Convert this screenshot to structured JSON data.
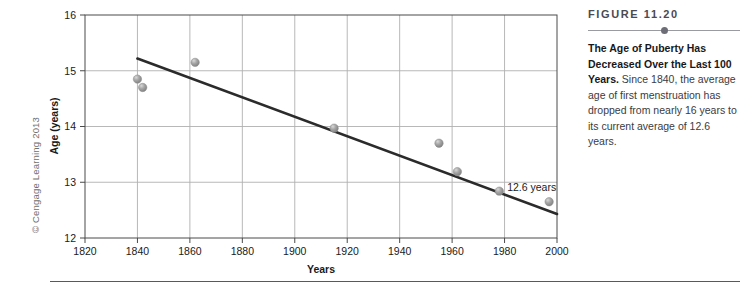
{
  "copyright": "© Cengage Learning 2013",
  "caption": {
    "figure_number": "FIGURE 11.20",
    "lead": "The Age of Puberty Has Decreased Over the Last 100 Years.",
    "body": " Since 1840, the average age of first menstruation has dropped from nearly 16 years to its current average of 12.6 years."
  },
  "colors": {
    "trend_line": "#2b2b2b",
    "grid": "#b0b0b0",
    "axis": "#4a4a4a",
    "point_fill": "#9b9b9b",
    "point_highlight": "#d8d8d8",
    "caption_heading": "#4a4a52",
    "caption_text": "#3b3b41",
    "rule": "#9a9aa2"
  },
  "chart_data": {
    "type": "scatter",
    "title": "",
    "xlabel": "Years",
    "ylabel": "Age (years)",
    "xlim": [
      1820,
      2000
    ],
    "ylim": [
      12,
      16
    ],
    "xticks": [
      1820,
      1840,
      1860,
      1880,
      1900,
      1920,
      1940,
      1960,
      1980,
      2000
    ],
    "yticks": [
      12,
      13,
      14,
      15,
      16
    ],
    "xtick_labels": [
      "1820",
      "1840",
      "1860",
      "1880",
      "1900",
      "1920",
      "1940",
      "1960",
      "1980",
      "2000"
    ],
    "ytick_labels": [
      "12",
      "13",
      "14",
      "15",
      "16"
    ],
    "grid": true,
    "legend": false,
    "points": [
      {
        "x": 1840,
        "y": 14.85
      },
      {
        "x": 1842,
        "y": 14.7
      },
      {
        "x": 1862,
        "y": 15.15
      },
      {
        "x": 1915,
        "y": 13.97
      },
      {
        "x": 1955,
        "y": 13.7
      },
      {
        "x": 1962,
        "y": 13.19
      },
      {
        "x": 1978,
        "y": 12.84
      },
      {
        "x": 1997,
        "y": 12.65
      }
    ],
    "trend_line": {
      "x0": 1840,
      "y0": 15.22,
      "x1": 2000,
      "y1": 12.43
    },
    "annotations": [
      {
        "text": "12.6 years",
        "x": 1981,
        "y": 12.9
      }
    ]
  }
}
